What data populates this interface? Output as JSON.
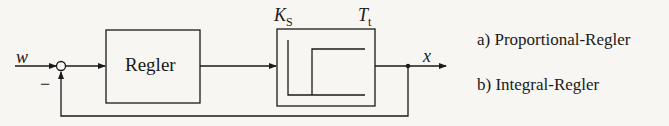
{
  "diagram": {
    "input_signal": "w",
    "output_signal": "x",
    "feedback_sign": "−",
    "controller_block": {
      "label": "Regler"
    },
    "plant_block": {
      "gain_label": "K",
      "gain_subscript": "S",
      "deadtime_label": "T",
      "deadtime_subscript": "t",
      "icon": "deadtime-step-response-icon"
    }
  },
  "options": [
    {
      "label": "a) Proportional-Regler"
    },
    {
      "label": "b) Integral-Regler"
    }
  ],
  "colors": {
    "line": "#1a1a1a",
    "background": "#f7f6f3"
  }
}
